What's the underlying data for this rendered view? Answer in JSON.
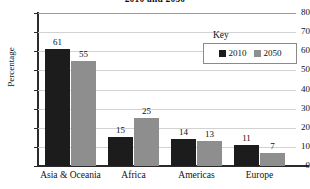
{
  "chart_data": {
    "type": "bar",
    "title": "2010 and 2050",
    "xlabel": "",
    "ylabel": "Percentage",
    "ylim": [
      0,
      80
    ],
    "yticks": [
      "0",
      "10",
      "20",
      "30",
      "40",
      "50",
      "60",
      "70",
      "80"
    ],
    "grid": true,
    "legend_position": "inside-top-right",
    "legend_title": "Key",
    "categories": [
      "Asia & Oceania",
      "Africa",
      "Americas",
      "Europe"
    ],
    "series": [
      {
        "name": "2010",
        "color": "#1c1c1c",
        "values": [
          61,
          15,
          14,
          11
        ]
      },
      {
        "name": "2050",
        "color": "#8e8e8e",
        "values": [
          55,
          25,
          13,
          7
        ]
      }
    ]
  }
}
